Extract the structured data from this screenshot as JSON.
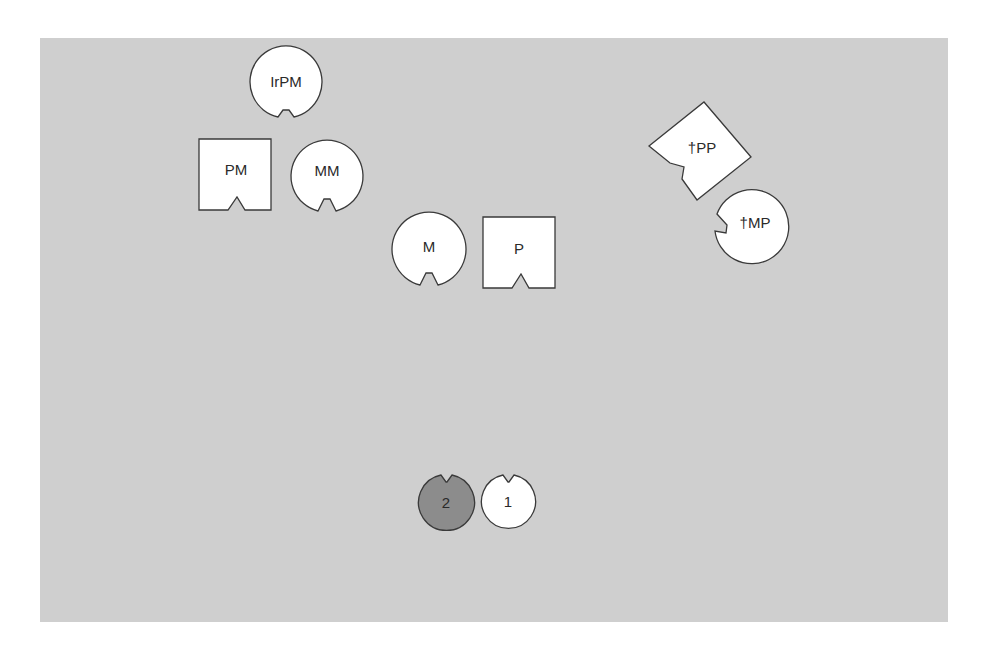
{
  "colors": {
    "background": "#cfcfcf",
    "shape_fill": "#ffffff",
    "shape_fill_dark": "#8c8c8c",
    "stroke": "#3a3a3a"
  },
  "shapes": [
    {
      "id": "irpm",
      "label": "IrPM",
      "type": "circle-notched",
      "cx": 286,
      "cy": 82,
      "r": 36,
      "notch": "bottom"
    },
    {
      "id": "pm",
      "label": "PM",
      "type": "square-notched",
      "x": 199,
      "y": 139,
      "w": 72,
      "h": 71,
      "notch": "bottom"
    },
    {
      "id": "mm",
      "label": "MM",
      "type": "circle-notched",
      "cx": 327,
      "cy": 176,
      "r": 36,
      "notch": "bottom"
    },
    {
      "id": "m",
      "label": "M",
      "type": "circle-notched",
      "cx": 429,
      "cy": 249,
      "r": 37,
      "notch": "bottom"
    },
    {
      "id": "p",
      "label": "P",
      "type": "square-notched",
      "x": 483,
      "y": 217,
      "w": 72,
      "h": 71,
      "notch": "bottom"
    },
    {
      "id": "dpp",
      "label": "†PP",
      "type": "square-notched-rotated",
      "notch": "left"
    },
    {
      "id": "dmp",
      "label": "†MP",
      "type": "circle-notched",
      "cx": 751,
      "cy": 224,
      "r": 37,
      "notch": "left"
    },
    {
      "id": "s2",
      "label": "2",
      "type": "circle-notched",
      "cx": 446,
      "cy": 502,
      "r": 28,
      "notch": "top",
      "dark": true
    },
    {
      "id": "s1",
      "label": "1",
      "type": "circle-notched",
      "cx": 508,
      "cy": 501,
      "r": 27,
      "notch": "top"
    }
  ]
}
